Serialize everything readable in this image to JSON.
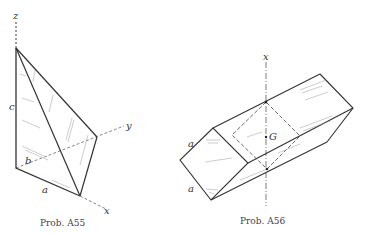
{
  "figures": [
    {
      "caption": "Prob. A55",
      "shape": "tetrahedron",
      "labels": {
        "z": "z",
        "y": "y",
        "x": "x",
        "a": "a",
        "b": "b",
        "c": "c"
      }
    },
    {
      "caption": "Prob. A56",
      "shape": "square prism",
      "labels": {
        "x": "x",
        "G": "G",
        "a_top": "a",
        "a_bottom": "a"
      }
    }
  ],
  "colors": {
    "line": "#333333",
    "hatch": "#888888",
    "background": "#ffffff"
  }
}
